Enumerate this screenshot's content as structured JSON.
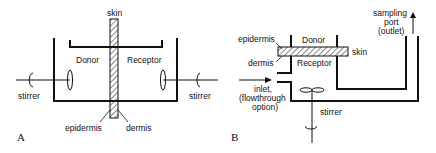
{
  "panel_a": {
    "panel_label": "A",
    "labels": {
      "skin": "skin",
      "donor": "Donor",
      "receptor": "Receptor",
      "stirrer_left": "stirrer",
      "stirrer_right": "stirrer",
      "epidermis": "epidermis",
      "dermis": "dermis"
    }
  },
  "panel_b": {
    "panel_label": "B",
    "labels": {
      "sampling_port_1": "sampling",
      "sampling_port_2": "port",
      "sampling_port_3": "(outlet)",
      "epidermis": "epidermis",
      "donor": "Donor",
      "skin": "skin",
      "dermis": "dermis",
      "receptor": "Receptor",
      "inlet_1": "inlet,",
      "inlet_2": "(flowthrough",
      "inlet_3": "option)",
      "stirrer": "stirrer"
    }
  },
  "colors": {
    "line": "#111111",
    "background": "#ffffff"
  }
}
